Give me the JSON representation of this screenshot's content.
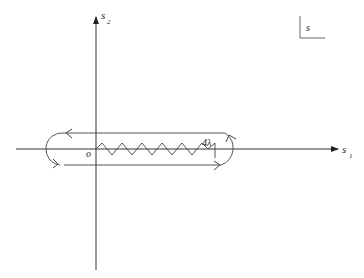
{
  "diagram": {
    "axes": {
      "horizontal_label": "s",
      "horizontal_subscript": "1",
      "vertical_label": "s",
      "vertical_subscript": "2"
    },
    "origin_label": "o",
    "branch_point_label": "4λ",
    "plane_label": "s",
    "colors": {
      "line": "#333333",
      "contour": "#555555",
      "background": "#ffffff"
    }
  }
}
